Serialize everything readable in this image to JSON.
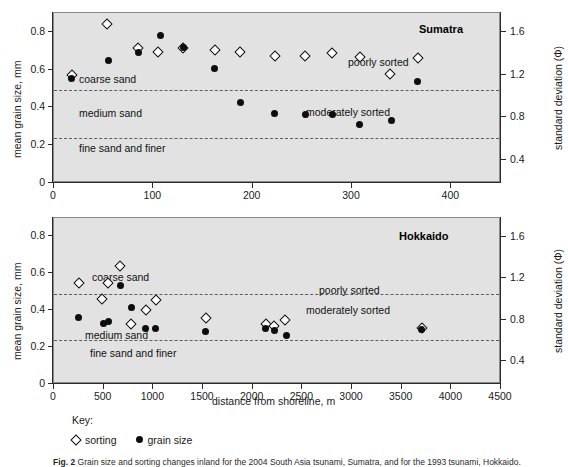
{
  "figure": {
    "caption_prefix": "Fig. 2",
    "caption_text": "Grain size and sorting changes inland for the 2004 South Asia tsunami, Sumatra, and for the 1993 tsunami, Hokkaido.",
    "key_title": "Key:",
    "key_items": [
      {
        "marker": "diamond",
        "label": "sorting"
      },
      {
        "marker": "circle",
        "label": "grain size"
      }
    ],
    "shared_xlabel": "distance from shoreline, m",
    "shared_ylabel_left": "mean grain size, mm",
    "shared_ylabel_right": "standard deviation (Φ)",
    "zone_labels": [
      "coarse sand",
      "medium sand",
      "fine sand and finer"
    ],
    "sorting_labels": [
      "poorly sorted",
      "moderately sorted"
    ]
  },
  "chart_data": [
    {
      "type": "scatter",
      "title": "Sumatra",
      "xlabel": "distance from shoreline, m",
      "ylabel": "mean grain size, mm",
      "y2label": "standard deviation (Φ)",
      "xlim": [
        0,
        450
      ],
      "ylim": [
        0,
        0.9
      ],
      "y2lim": [
        0.18,
        1.78
      ],
      "xticks": [
        0,
        100,
        200,
        300,
        400
      ],
      "xticklabels": [
        "0",
        "100",
        "200",
        "300",
        "400"
      ],
      "yticks": [
        0,
        0.2,
        0.4,
        0.6,
        0.8
      ],
      "yticklabels": [
        "0",
        "0.2",
        "0.4",
        "0.6",
        "0.8"
      ],
      "y2ticks": [
        0.4,
        0.8,
        1.2,
        1.6
      ],
      "y2ticklabels": [
        "0.4",
        "0.8",
        "1.2",
        "1.6"
      ],
      "grid": false,
      "reference_lines": [
        {
          "y": 0.49,
          "label": "coarse sand / medium sand boundary",
          "style": "dashed"
        },
        {
          "y": 0.24,
          "label": "medium sand / fine sand boundary",
          "style": "dashed"
        }
      ],
      "annotations": [
        {
          "text": "coarse sand",
          "x": 30,
          "y": 0.555
        },
        {
          "text": "medium sand",
          "x": 30,
          "y": 0.375
        },
        {
          "text": "fine sand and finer",
          "x": 30,
          "y": 0.19
        },
        {
          "text": "poorly sorted",
          "x": 300,
          "y": 0.665
        },
        {
          "text": "moderately sorted",
          "x": 260,
          "y": 0.4
        },
        {
          "text": "Sumatra",
          "x": 380,
          "y": 0.845
        }
      ],
      "series": [
        {
          "name": "sorting",
          "marker": "diamond",
          "axis": "right",
          "points": [
            {
              "x": 18,
              "y_mm_scale": 0.572
            },
            {
              "x": 53,
              "y_mm_scale": 0.842
            },
            {
              "x": 85,
              "y_mm_scale": 0.715
            },
            {
              "x": 105,
              "y_mm_scale": 0.693
            },
            {
              "x": 130,
              "y_mm_scale": 0.717
            },
            {
              "x": 162,
              "y_mm_scale": 0.703
            },
            {
              "x": 187,
              "y_mm_scale": 0.692
            },
            {
              "x": 222,
              "y_mm_scale": 0.67
            },
            {
              "x": 253,
              "y_mm_scale": 0.673
            },
            {
              "x": 280,
              "y_mm_scale": 0.688
            },
            {
              "x": 308,
              "y_mm_scale": 0.668
            },
            {
              "x": 338,
              "y_mm_scale": 0.578
            },
            {
              "x": 366,
              "y_mm_scale": 0.662
            }
          ]
        },
        {
          "name": "grain size",
          "marker": "circle",
          "axis": "left",
          "points": [
            {
              "x": 18,
              "y": 0.555
            },
            {
              "x": 55,
              "y": 0.65
            },
            {
              "x": 85,
              "y": 0.69
            },
            {
              "x": 107,
              "y": 0.782
            },
            {
              "x": 130,
              "y": 0.715
            },
            {
              "x": 162,
              "y": 0.608
            },
            {
              "x": 188,
              "y": 0.428
            },
            {
              "x": 222,
              "y": 0.367
            },
            {
              "x": 253,
              "y": 0.363
            },
            {
              "x": 280,
              "y": 0.365
            },
            {
              "x": 308,
              "y": 0.31
            },
            {
              "x": 340,
              "y": 0.33
            },
            {
              "x": 366,
              "y": 0.54
            }
          ]
        }
      ]
    },
    {
      "type": "scatter",
      "title": "Hokkaido",
      "xlabel": "distance from shoreline, m",
      "ylabel": "mean grain size, mm",
      "y2label": "standard deviation (Φ)",
      "xlim": [
        0,
        4500
      ],
      "ylim": [
        0,
        0.9
      ],
      "y2lim": [
        0.18,
        1.78
      ],
      "xticks": [
        0,
        500,
        1000,
        1500,
        2000,
        2500,
        3000,
        3500,
        4000,
        4500
      ],
      "xticklabels": [
        "0",
        "500",
        "1000",
        "1500",
        "2000",
        "2500",
        "3000",
        "3500",
        "4000",
        "4500"
      ],
      "yticks": [
        0,
        0.2,
        0.4,
        0.6,
        0.8
      ],
      "yticklabels": [
        "0",
        "0.2",
        "0.4",
        "0.6",
        "0.8"
      ],
      "y2ticks": [
        0.4,
        0.8,
        1.2,
        1.6
      ],
      "y2ticklabels": [
        "0.4",
        "0.8",
        "1.2",
        "1.6"
      ],
      "grid": false,
      "reference_lines": [
        {
          "y": 0.49,
          "label": "coarse sand / medium sand boundary",
          "style": "dashed"
        },
        {
          "y": 0.24,
          "label": "medium sand / fine sand boundary",
          "style": "dashed"
        }
      ],
      "annotations": [
        {
          "text": "coarse sand",
          "x": 430,
          "y": 0.605
        },
        {
          "text": "medium sand",
          "x": 350,
          "y": 0.3
        },
        {
          "text": "fine sand and finer",
          "x": 400,
          "y": 0.195
        },
        {
          "text": "poorly sorted",
          "x": 2700,
          "y": 0.56
        },
        {
          "text": "moderately sorted",
          "x": 2560,
          "y": 0.44
        },
        {
          "text": "Hokkaido",
          "x": 3380,
          "y": 0.84
        }
      ],
      "series": [
        {
          "name": "sorting",
          "marker": "diamond",
          "axis": "right",
          "points": [
            {
              "x": 250,
              "y_mm_scale": 0.548
            },
            {
              "x": 480,
              "y_mm_scale": 0.462
            },
            {
              "x": 545,
              "y_mm_scale": 0.545
            },
            {
              "x": 660,
              "y_mm_scale": 0.64
            },
            {
              "x": 780,
              "y_mm_scale": 0.327
            },
            {
              "x": 930,
              "y_mm_scale": 0.402
            },
            {
              "x": 1030,
              "y_mm_scale": 0.458
            },
            {
              "x": 1530,
              "y_mm_scale": 0.358
            },
            {
              "x": 2130,
              "y_mm_scale": 0.328
            },
            {
              "x": 2215,
              "y_mm_scale": 0.312
            },
            {
              "x": 2330,
              "y_mm_scale": 0.348
            },
            {
              "x": 3700,
              "y_mm_scale": 0.303
            }
          ]
        },
        {
          "name": "grain size",
          "marker": "circle",
          "axis": "left",
          "points": [
            {
              "x": 250,
              "y": 0.36
            },
            {
              "x": 495,
              "y": 0.33
            },
            {
              "x": 545,
              "y": 0.34
            },
            {
              "x": 665,
              "y": 0.535
            },
            {
              "x": 780,
              "y": 0.415
            },
            {
              "x": 925,
              "y": 0.303
            },
            {
              "x": 1020,
              "y": 0.303
            },
            {
              "x": 1530,
              "y": 0.283
            },
            {
              "x": 2125,
              "y": 0.3
            },
            {
              "x": 2220,
              "y": 0.288
            },
            {
              "x": 2345,
              "y": 0.262
            },
            {
              "x": 3700,
              "y": 0.295
            }
          ]
        }
      ]
    }
  ]
}
